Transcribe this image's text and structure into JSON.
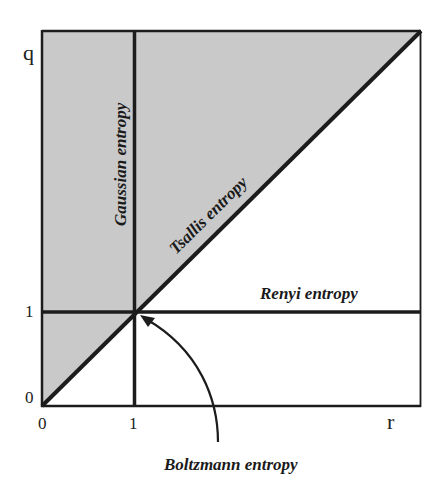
{
  "diagram": {
    "axes": {
      "x_label": "r",
      "y_label": "q",
      "x_ticks": [
        "0",
        "1"
      ],
      "y_ticks": [
        "0",
        "1"
      ]
    },
    "regions": {
      "shaded_region": "q > r (above diagonal)",
      "shade_color": "#c9c9c9"
    },
    "labels": {
      "gaussian": "Gaussian entropy",
      "tsallis": "Tsallis entropy",
      "renyi": "Renyi entropy",
      "boltzmann": "Boltzmann entropy"
    },
    "colors": {
      "line": "#1c1c1c",
      "background": "#ffffff"
    }
  }
}
